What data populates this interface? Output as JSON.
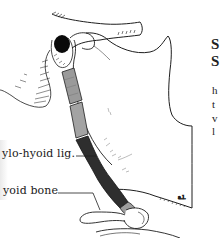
{
  "figure": {
    "labels": {
      "stylohyoid": "ylo-hyoid lig.",
      "hyoid": "yoid bone"
    },
    "colors": {
      "ligament_light": "#9a9a9a",
      "ligament_dark": "#2e2e2e",
      "ear_canal": "#0a0a0a",
      "line": "#1e1e1e"
    }
  },
  "side_text": {
    "heading_lines": [
      "S",
      "S"
    ],
    "body_lines": [
      "h",
      "t",
      "v",
      "l"
    ]
  }
}
